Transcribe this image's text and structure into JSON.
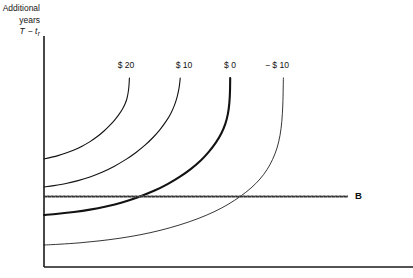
{
  "figure": {
    "background_color": "#ffffff",
    "axis_color": "#1a1a1a",
    "curve_color": "#121212",
    "budget_line_color": "#2b2b2b",
    "width": 413,
    "height": 278
  },
  "y_axis_caption": {
    "line1": "Additional",
    "line2": "years",
    "line3_main": "T − t",
    "line3_sub": "r"
  },
  "chart_data": {
    "type": "line",
    "title": "",
    "xlabel": "",
    "ylabel": "Additional years T − t_r",
    "grid": false,
    "legend_position": "inline-top",
    "axes": {
      "x_origin_px": 44,
      "x_end_px": 413,
      "y_top_px": 36,
      "y_bottom_px": 267,
      "x_tick_labels": [],
      "y_tick_labels": []
    },
    "annotations": [
      {
        "text": "B",
        "x_px": 355,
        "y_px": 197,
        "bold": true
      }
    ],
    "series": [
      {
        "name": "$ 20",
        "label": "$ 20",
        "label_x_px": 126,
        "label_y_px": 66,
        "emphasis": "normal",
        "stroke_width": 1.1,
        "y_intercept_px": 159,
        "top_x_px": 129,
        "top_y_px": 78,
        "points_px": [
          [
            44,
            159
          ],
          [
            50,
            157.6
          ],
          [
            58,
            155.6
          ],
          [
            66,
            153.1
          ],
          [
            74,
            150.0
          ],
          [
            82,
            146.2
          ],
          [
            90,
            141.6
          ],
          [
            97,
            136.8
          ],
          [
            104,
            131.0
          ],
          [
            110,
            125.2
          ],
          [
            115,
            119.6
          ],
          [
            119,
            114.4
          ],
          [
            122.5,
            109.0
          ],
          [
            125,
            104.0
          ],
          [
            126.8,
            99.0
          ],
          [
            128,
            93.5
          ],
          [
            128.8,
            87.5
          ],
          [
            129.2,
            82.0
          ],
          [
            129.4,
            78.0
          ]
        ]
      },
      {
        "name": "$ 10",
        "label": "$ 10",
        "label_x_px": 184,
        "label_y_px": 66,
        "emphasis": "normal",
        "stroke_width": 1.1,
        "y_intercept_px": 187,
        "top_x_px": 180,
        "top_y_px": 78,
        "points_px": [
          [
            44,
            187
          ],
          [
            54,
            185.6
          ],
          [
            66,
            183.5
          ],
          [
            78,
            180.6
          ],
          [
            90,
            176.9
          ],
          [
            102,
            172.2
          ],
          [
            114,
            166.4
          ],
          [
            126,
            159.4
          ],
          [
            136,
            152.5
          ],
          [
            145,
            145.2
          ],
          [
            153,
            137.5
          ],
          [
            160,
            129.6
          ],
          [
            166,
            121.4
          ],
          [
            170.8,
            113.4
          ],
          [
            174.4,
            105.4
          ],
          [
            177.0,
            97.4
          ],
          [
            178.8,
            89.4
          ],
          [
            179.8,
            82.4
          ],
          [
            180.2,
            78.0
          ]
        ]
      },
      {
        "name": "$ 0",
        "label": "$ 0",
        "label_x_px": 230,
        "label_y_px": 66,
        "emphasis": "bold",
        "stroke_width": 2.1,
        "y_intercept_px": 215,
        "top_x_px": 230,
        "top_y_px": 78,
        "points_px": [
          [
            44,
            215
          ],
          [
            58,
            213.8
          ],
          [
            74,
            212.0
          ],
          [
            90,
            209.6
          ],
          [
            106,
            206.4
          ],
          [
            122,
            202.4
          ],
          [
            138,
            197.2
          ],
          [
            154,
            190.8
          ],
          [
            168,
            183.8
          ],
          [
            180,
            176.6
          ],
          [
            191,
            168.8
          ],
          [
            201,
            160.2
          ],
          [
            209,
            151.6
          ],
          [
            216,
            142.4
          ],
          [
            221.4,
            133.2
          ],
          [
            225.4,
            123.6
          ],
          [
            228.0,
            113.4
          ],
          [
            229.4,
            102.4
          ],
          [
            230.0,
            91.0
          ],
          [
            230.2,
            78.0
          ]
        ]
      },
      {
        "name": "− $ 10",
        "label": "− $ 10",
        "label_x_px": 277,
        "label_y_px": 66,
        "emphasis": "thin",
        "stroke_width": 0.85,
        "y_intercept_px": 245,
        "top_x_px": 283,
        "top_y_px": 78,
        "points_px": [
          [
            44,
            245
          ],
          [
            60,
            244.2
          ],
          [
            80,
            242.8
          ],
          [
            100,
            240.8
          ],
          [
            120,
            238.2
          ],
          [
            140,
            234.8
          ],
          [
            160,
            230.4
          ],
          [
            180,
            224.8
          ],
          [
            198,
            218.6
          ],
          [
            214,
            211.8
          ],
          [
            228,
            204.4
          ],
          [
            240,
            196.6
          ],
          [
            251,
            188.0
          ],
          [
            260,
            179.0
          ],
          [
            267,
            169.6
          ],
          [
            272.6,
            159.4
          ],
          [
            277.0,
            148.0
          ],
          [
            280.0,
            135.4
          ],
          [
            281.8,
            121.4
          ],
          [
            282.8,
            105.0
          ],
          [
            283.2,
            88.0
          ],
          [
            283.4,
            78.0
          ]
        ]
      }
    ],
    "reference_lines": [
      {
        "name": "B",
        "label": "B",
        "orientation": "horizontal",
        "y_px": 196.5,
        "x_start_px": 44,
        "x_end_px": 348,
        "style": "textured",
        "stroke_width": 2.0
      }
    ]
  }
}
